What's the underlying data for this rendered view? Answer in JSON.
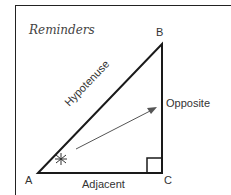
{
  "title": "Reminders",
  "vertices": {
    "A": "A",
    "B": "B",
    "C": "C"
  },
  "sides": {
    "hypotenuse": "Hypotenuse",
    "opposite": "Opposite",
    "adjacent": "Adjacent"
  },
  "angle_marker": "asterisk",
  "colors": {
    "line": "#1a1a1a",
    "arrow": "#555555",
    "text": "#333333"
  }
}
